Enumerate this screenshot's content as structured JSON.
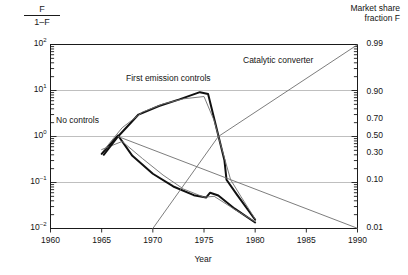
{
  "chart_data": {
    "type": "line",
    "title": "",
    "xlabel": "Year",
    "ylabel_left_numerator": "F",
    "ylabel_left_denominator": "1–F",
    "ylabel_right_line1": "Market share",
    "ylabel_right_line2": "fraction F",
    "xlim": [
      1960,
      1990
    ],
    "xticks": [
      1960,
      1965,
      1970,
      1975,
      1980,
      1985,
      1990
    ],
    "xticklabels": [
      "1960",
      "1965",
      "1970",
      "1975",
      "1980",
      "1985",
      "1990"
    ],
    "yscale": "log",
    "ylim": [
      0.01,
      100
    ],
    "yticks_left": [
      0.01,
      0.1,
      1,
      10,
      100
    ],
    "yticklabels_left": [
      "10-2",
      "10-1",
      "100",
      "101",
      "102"
    ],
    "yticklabels_left_display": [
      {
        "base": "10",
        "exp": "–2"
      },
      {
        "base": "10",
        "exp": "–1"
      },
      {
        "base": "10",
        "exp": "0"
      },
      {
        "base": "10",
        "exp": "1"
      },
      {
        "base": "10",
        "exp": "2"
      }
    ],
    "yticks_right_F": [
      0.01,
      0.1,
      0.3,
      0.5,
      0.7,
      0.9,
      0.99
    ],
    "yticklabels_right": [
      "0.01",
      "0.10",
      "0.30",
      "0.50",
      "0.70",
      "0.90",
      "0.99"
    ],
    "gridlines_y": [
      10,
      1,
      0.1
    ],
    "grid": true,
    "legend_position": "inline-annotations",
    "annotations": [
      {
        "label": "No controls",
        "x": 1962.4,
        "y": 2.0
      },
      {
        "label": "First emission controls",
        "x": 1969.6,
        "y": 11.5
      },
      {
        "label": "Catalytic converter",
        "x": 1979.6,
        "y": 33.0
      }
    ],
    "series": [
      {
        "name": "No controls",
        "style": "thick-black",
        "points": [
          [
            1965.0,
            0.42
          ],
          [
            1966.6,
            1.05
          ],
          [
            1968.0,
            0.38
          ],
          [
            1970.0,
            0.155
          ],
          [
            1972.0,
            0.082
          ],
          [
            1974.0,
            0.053
          ],
          [
            1975.2,
            0.047
          ],
          [
            1975.6,
            0.06
          ],
          [
            1976.4,
            0.052
          ],
          [
            1978.0,
            0.027
          ],
          [
            1980.0,
            0.0135
          ]
        ]
      },
      {
        "name": "No controls (model fit)",
        "style": "thin-gray",
        "points": [
          [
            1965.0,
            0.52
          ],
          [
            1967.0,
            0.78
          ],
          [
            1969.0,
            0.33
          ],
          [
            1971.0,
            0.145
          ],
          [
            1973.0,
            0.072
          ],
          [
            1975.0,
            0.048
          ],
          [
            1976.0,
            0.05
          ],
          [
            1978.0,
            0.026
          ],
          [
            1980.0,
            0.014
          ]
        ]
      },
      {
        "name": "First emission controls",
        "style": "thick-black",
        "points": [
          [
            1965.2,
            0.4
          ],
          [
            1966.6,
            1.0
          ],
          [
            1968.6,
            3.0
          ],
          [
            1970.6,
            4.6
          ],
          [
            1972.6,
            6.4
          ],
          [
            1974.6,
            9.2
          ],
          [
            1975.4,
            8.4
          ],
          [
            1976.4,
            1.05
          ],
          [
            1977.0,
            0.3
          ],
          [
            1977.2,
            0.115
          ],
          [
            1978.2,
            0.055
          ],
          [
            1980.0,
            0.0155
          ]
        ]
      },
      {
        "name": "First emission controls (model fit)",
        "style": "thin-gray",
        "points": [
          [
            1965.2,
            0.5
          ],
          [
            1967.0,
            1.55
          ],
          [
            1969.0,
            3.4
          ],
          [
            1971.0,
            5.1
          ],
          [
            1973.0,
            6.6
          ],
          [
            1975.0,
            7.4
          ],
          [
            1976.0,
            2.2
          ],
          [
            1976.6,
            0.7
          ],
          [
            1977.6,
            0.115
          ],
          [
            1978.6,
            0.05
          ],
          [
            1980.0,
            0.016
          ]
        ]
      },
      {
        "name": "Catalytic converter",
        "style": "thin-gray",
        "points": [
          [
            1970.0,
            0.01
          ],
          [
            1976.4,
            1.0
          ],
          [
            1990.0,
            99.0
          ]
        ]
      },
      {
        "name": "Catalytic converter decline",
        "style": "thin-gray",
        "points": [
          [
            1966.6,
            1.0
          ],
          [
            1990.0,
            0.0101
          ]
        ]
      }
    ]
  }
}
